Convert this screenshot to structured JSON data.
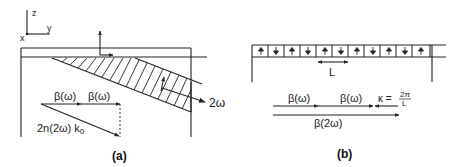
{
  "panel_a": {
    "caption": "(a)",
    "axes": {
      "z": "z",
      "y": "y",
      "x": "x"
    },
    "output_label": "2ω",
    "vectors": {
      "beta1": "β(ω)",
      "beta2": "β(ω)",
      "resultant": "2n(2ω) k",
      "resultant_sub": "0"
    }
  },
  "panel_b": {
    "caption": "(b)",
    "period_label": "L",
    "domain_arrows": [
      "up",
      "down",
      "up",
      "down",
      "up",
      "down",
      "up",
      "down",
      "up",
      "down",
      "up"
    ],
    "vectors": {
      "beta1": "β(ω)",
      "beta2": "β(ω)",
      "kappa": "κ =",
      "kappa_num": "2π",
      "kappa_den": "L",
      "beta_sh": "β(2ω)"
    }
  },
  "colors": {
    "ink": "#222222",
    "background": "#ffffff"
  }
}
